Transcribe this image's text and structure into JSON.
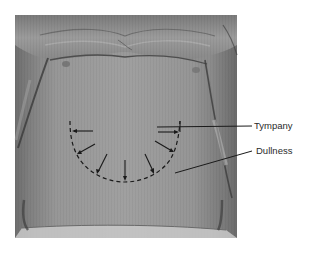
{
  "figure": {
    "labels": {
      "tympany": "Tympany",
      "dullness": "Dullness"
    },
    "colors": {
      "background": "#ffffff",
      "photo_base": "#8a8a8a",
      "annotation": "#1a1a1a",
      "label_text": "#2a2a2a"
    },
    "annotations": {
      "dashed_boundary": "semicircular dashed line marking boundary of dullness",
      "arrows_count": 7,
      "arrow_direction": "outward from center toward boundary"
    }
  }
}
